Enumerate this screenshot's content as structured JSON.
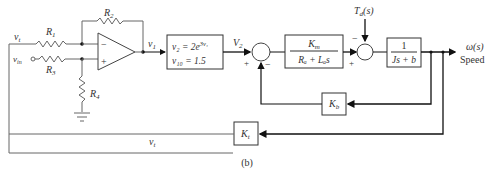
{
  "diagram": {
    "caption": "(b)",
    "circuit": {
      "R1": "R",
      "R1_sub": "1",
      "R2": "R",
      "R2_sub": "2",
      "R3": "R",
      "R3_sub": "3",
      "R4": "R",
      "R4_sub": "4",
      "vt_in": "v",
      "vt_in_sub": "t",
      "vin": "v",
      "vin_sub": "in",
      "v1": "v",
      "v1_sub": "1",
      "opamp_minus": "−",
      "opamp_plus": "+"
    },
    "nonlinear_block": {
      "line1": "v₂ = 2e",
      "line1_exp": "3v₁",
      "line2": "v₁₀ = 1.5"
    },
    "V2_label": "V",
    "V2_sub": "2",
    "sum1": {
      "plus": "+",
      "minus": "−"
    },
    "motor_block": {
      "num": "K",
      "num_sub": "m",
      "den": "Rₐ + Lₐs"
    },
    "disturbance": {
      "label": "T",
      "label_sub": "d",
      "label_tail": "(s)"
    },
    "sum2": {
      "plus": "+",
      "minus": "−"
    },
    "load_block": {
      "num": "1",
      "den": "Js + b"
    },
    "output": {
      "label": "ω(s)",
      "sublabel": "Speed"
    },
    "kb_block": {
      "label": "K",
      "sub": "b"
    },
    "kt_block": {
      "label": "K",
      "sub": "t"
    },
    "vt_feedback": {
      "label": "v",
      "sub": "t"
    }
  }
}
